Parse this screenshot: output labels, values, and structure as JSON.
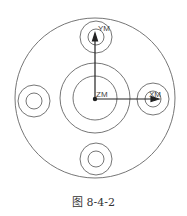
{
  "diagram": {
    "type": "cad-part-top-view",
    "axes": {
      "x_label": "XM",
      "y_label": "YM",
      "z_label": "ZM"
    },
    "colors": {
      "line": "#555555",
      "axis": "#222222",
      "background": "#ffffff"
    }
  },
  "caption": "图 8-4-2"
}
